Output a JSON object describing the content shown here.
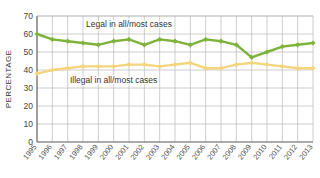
{
  "chart_data": {
    "type": "line",
    "title": "",
    "xlabel": "",
    "ylabel": "PERCENTAGE",
    "ylim": [
      0,
      70
    ],
    "yticks": [
      0,
      10,
      20,
      30,
      40,
      50,
      60,
      70
    ],
    "grid": true,
    "legend_position": "inline-annotation",
    "x": [
      "1995",
      "1996",
      "1997",
      "1998",
      "1999",
      "2000",
      "2001",
      "2002",
      "2003",
      "2004",
      "2005",
      "2006",
      "2007",
      "2008",
      "2009",
      "2010",
      "2011",
      "2012",
      "2013"
    ],
    "categories": [
      "1995",
      "1996",
      "1997",
      "1998",
      "1999",
      "2000",
      "2001",
      "2002",
      "2003",
      "2004",
      "2005",
      "2006",
      "2007",
      "2008",
      "2009",
      "2010",
      "2011",
      "2012",
      "2013"
    ],
    "series": [
      {
        "name": "Legal in all/most cases",
        "color": "#7DB33B",
        "marker": "diamond",
        "values": [
          60,
          57,
          56,
          55,
          54,
          56,
          57,
          54,
          57,
          56,
          54,
          57,
          56,
          54,
          47,
          50,
          53,
          54,
          55
        ]
      },
      {
        "name": "Illegal in all/most cases",
        "color": "#F2D57E",
        "marker": "diamond",
        "values": [
          38,
          40,
          41,
          42,
          42,
          42,
          43,
          43,
          42,
          43,
          44,
          41,
          41,
          43,
          44,
          43,
          42,
          41,
          41
        ]
      }
    ],
    "annotations": [
      {
        "text": "Legal in all/most cases",
        "x": "2001",
        "y": 64
      },
      {
        "text": "Illegal in all/most cases",
        "x": "2000",
        "y": 33
      }
    ]
  },
  "axis": {
    "y_title": "PERCENTAGE",
    "y_tick_labels": [
      "70",
      "60",
      "50",
      "40",
      "30",
      "20",
      "10",
      "0"
    ],
    "x_tick_labels": [
      "1995",
      "1996",
      "1997",
      "1998",
      "1999",
      "2000",
      "2001",
      "2002",
      "2003",
      "2004",
      "2005",
      "2006",
      "2007",
      "2008",
      "2009",
      "2010",
      "2011",
      "2012",
      "2013"
    ]
  },
  "legend": {
    "legal_label": "Legal in all/most cases",
    "illegal_label": "Illegal in all/most cases"
  },
  "colors": {
    "legal": "#7DB33B",
    "illegal": "#F2D57E",
    "grid": "#B8B8B8",
    "axis": "#6E6E6E",
    "background": "#FFFFFF",
    "text": "#333333"
  }
}
